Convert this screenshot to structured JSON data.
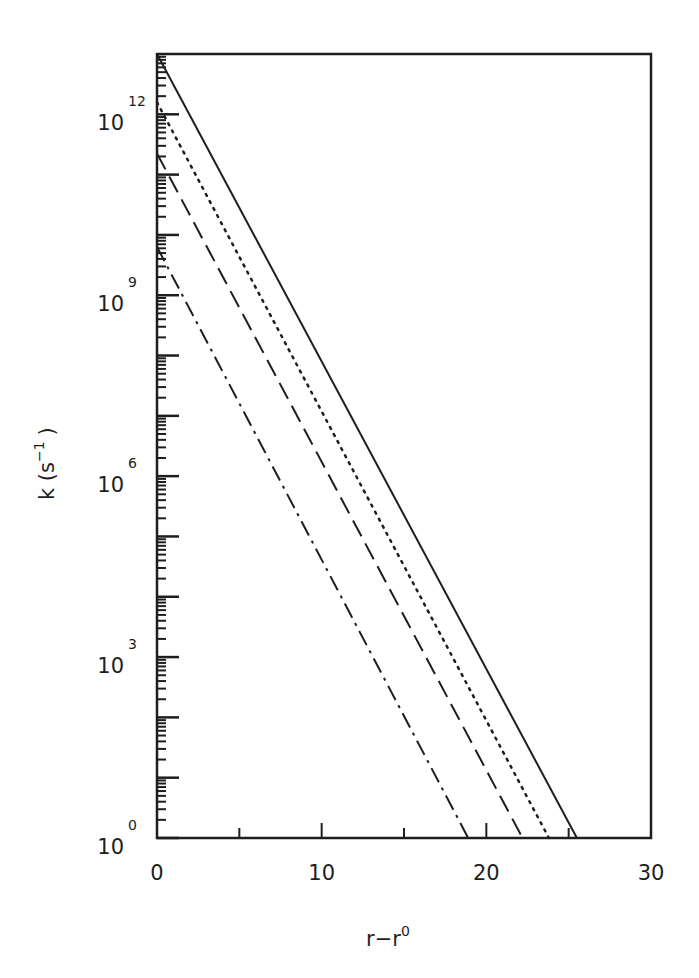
{
  "chart_data": {
    "type": "line",
    "title": "",
    "xlabel": "r−r⁰",
    "xlabel_base": "r−r",
    "xlabel_sup": "0",
    "ylabel": "k (s⁻¹)",
    "ylabel_base": "k (s",
    "ylabel_sup": "−1",
    "ylabel_tail": ")",
    "yscale": "log",
    "xlim": [
      0,
      30
    ],
    "ylim_log10": [
      0,
      13
    ],
    "grid": false,
    "legend": null,
    "x_ticks": [
      0,
      10,
      20,
      30
    ],
    "x_tick_labels": [
      "0",
      "10",
      "20",
      "30"
    ],
    "x_minor_ticks": [
      5,
      15,
      25
    ],
    "y_ticks_log10": [
      0,
      3,
      6,
      9,
      12
    ],
    "y_tick_labels": [
      {
        "base": "10",
        "exp": "0"
      },
      {
        "base": "10",
        "exp": "3"
      },
      {
        "base": "10",
        "exp": "6"
      },
      {
        "base": "10",
        "exp": "9"
      },
      {
        "base": "10",
        "exp": "12"
      }
    ],
    "series": [
      {
        "name": "solid",
        "style": "solid",
        "x": [
          0,
          25.5
        ],
        "log10_y": [
          13.0,
          0.0
        ]
      },
      {
        "name": "dotted",
        "style": "dotted",
        "x": [
          0,
          23.8
        ],
        "log10_y": [
          12.2,
          0.0
        ]
      },
      {
        "name": "dashed",
        "style": "dashed",
        "x": [
          0,
          22.2
        ],
        "log10_y": [
          11.35,
          0.0
        ]
      },
      {
        "name": "dash-dot",
        "style": "dashdot",
        "x": [
          0,
          18.9
        ],
        "log10_y": [
          9.8,
          0.0
        ]
      }
    ],
    "line_color": "#1e1e1e"
  }
}
